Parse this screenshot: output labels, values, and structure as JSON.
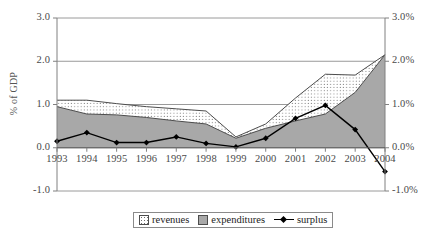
{
  "chart_data": {
    "type": "area",
    "title": "",
    "xlabel": "",
    "ylabel": "% of GDP",
    "y2label": "",
    "categories": [
      "1993",
      "1994",
      "1995",
      "1996",
      "1997",
      "1998",
      "1999",
      "2000",
      "2001",
      "2002",
      "2003",
      "2004"
    ],
    "ylim": [
      -1.0,
      3.0
    ],
    "y2lim": [
      -1.0,
      3.0
    ],
    "yticks": [
      "3.0",
      "2.0",
      "1.0",
      "0.0",
      "-1.0"
    ],
    "ytick_values": [
      3.0,
      2.0,
      1.0,
      0.0,
      -1.0
    ],
    "y2ticks": [
      "3.0%",
      "2.0%",
      "1.0%",
      "0.0%",
      "-1.0%"
    ],
    "y2tick_values": [
      3.0,
      2.0,
      1.0,
      0.0,
      -1.0
    ],
    "grid": true,
    "legend_position": "bottom",
    "series": [
      {
        "name": "revenues",
        "type": "area",
        "style": "dotted-fill",
        "values": [
          1.1,
          1.1,
          1.02,
          0.95,
          0.9,
          0.85,
          0.25,
          0.55,
          1.15,
          1.7,
          1.68,
          2.15
        ]
      },
      {
        "name": "expenditures",
        "type": "area",
        "style": "gray-fill",
        "values": [
          0.95,
          0.78,
          0.76,
          0.7,
          0.62,
          0.55,
          0.22,
          0.45,
          0.62,
          0.78,
          1.28,
          2.15
        ]
      },
      {
        "name": "surplus",
        "type": "line",
        "style": "black-diamond",
        "values": [
          0.15,
          0.35,
          0.12,
          0.12,
          0.25,
          0.1,
          0.02,
          0.22,
          0.68,
          0.98,
          0.42,
          -0.55
        ]
      }
    ]
  },
  "legend": {
    "items": [
      {
        "label": "revenues"
      },
      {
        "label": "expenditures"
      },
      {
        "label": "surplus"
      }
    ]
  },
  "colors": {
    "expenditures_fill": "#a8a8a8",
    "revenues_fill": "#ffffff",
    "surplus_line": "#000000",
    "axis": "#808080",
    "gridline": "#808080",
    "tick_text": "#4a4a4a"
  }
}
